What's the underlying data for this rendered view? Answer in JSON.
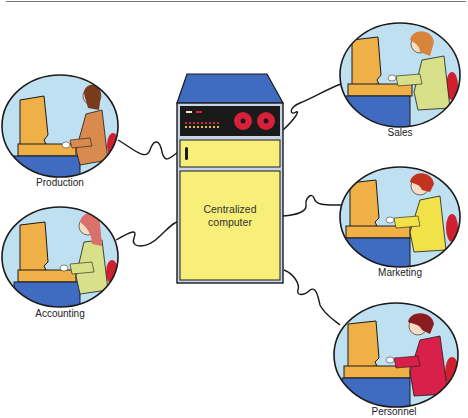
{
  "diagram": {
    "center": {
      "label_line1": "Centralized",
      "label_line2": "computer"
    },
    "workstations": [
      {
        "id": "production",
        "label": "Production",
        "shirt_color": "#d98a4e",
        "hair_color": "#7a3b1c"
      },
      {
        "id": "accounting",
        "label": "Accounting",
        "shirt_color": "#d9e08a",
        "hair_color": "#d9706a"
      },
      {
        "id": "sales",
        "label": "Sales",
        "shirt_color": "#d9e08a",
        "hair_color": "#d9843c"
      },
      {
        "id": "marketing",
        "label": "Marketing",
        "shirt_color": "#f2e24a",
        "hair_color": "#c2321e"
      },
      {
        "id": "personnel",
        "label": "Personnel",
        "shirt_color": "#d8204a",
        "hair_color": "#8a1c22"
      }
    ],
    "colors": {
      "cabinet_top": "#3f6bc0",
      "cabinet_body": "#f7ef7a",
      "panel": "#1a1a1a",
      "reels": "#d8203a",
      "circle_bg": "#bfe0f0",
      "terminal": "#f0b048",
      "desk": "#3f6bc0",
      "chair": "#d02030"
    }
  }
}
